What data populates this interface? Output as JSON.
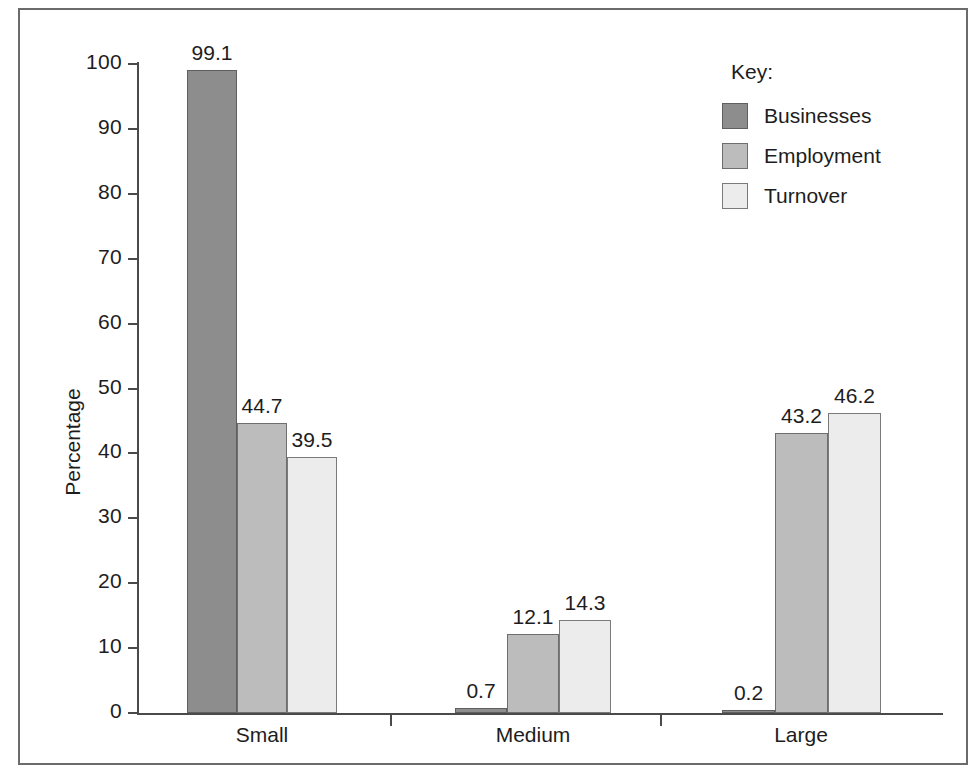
{
  "chart_data": {
    "type": "bar",
    "title": "",
    "xlabel": "",
    "ylabel": "Percentage",
    "categories": [
      "Small",
      "Medium",
      "Large"
    ],
    "series": [
      {
        "name": "Businesses",
        "color": "#8d8d8d",
        "values": [
          99.1,
          0.7,
          0.2
        ]
      },
      {
        "name": "Employment",
        "color": "#bcbcbc",
        "values": [
          44.7,
          12.1,
          43.2
        ]
      },
      {
        "name": "Turnover",
        "color": "#ececec",
        "values": [
          39.5,
          14.3,
          46.2
        ]
      }
    ],
    "value_labels": [
      [
        "99.1",
        "44.7",
        "39.5"
      ],
      [
        "0.7",
        "12.1",
        "14.3"
      ],
      [
        "0.2",
        "43.2",
        "46.2"
      ]
    ],
    "ylim": [
      0,
      100
    ],
    "ytick_labels": [
      "0",
      "10",
      "20",
      "30",
      "40",
      "50",
      "60",
      "70",
      "80",
      "90",
      "100"
    ],
    "ytick_values": [
      0,
      10,
      20,
      30,
      40,
      50,
      60,
      70,
      80,
      90,
      100
    ],
    "grid": false,
    "legend_position": "top-right"
  },
  "legend": {
    "title": "Key:",
    "entries": [
      {
        "label": "Businesses"
      },
      {
        "label": "Employment"
      },
      {
        "label": "Turnover"
      }
    ]
  },
  "axes": {
    "y_title": "Percentage"
  }
}
